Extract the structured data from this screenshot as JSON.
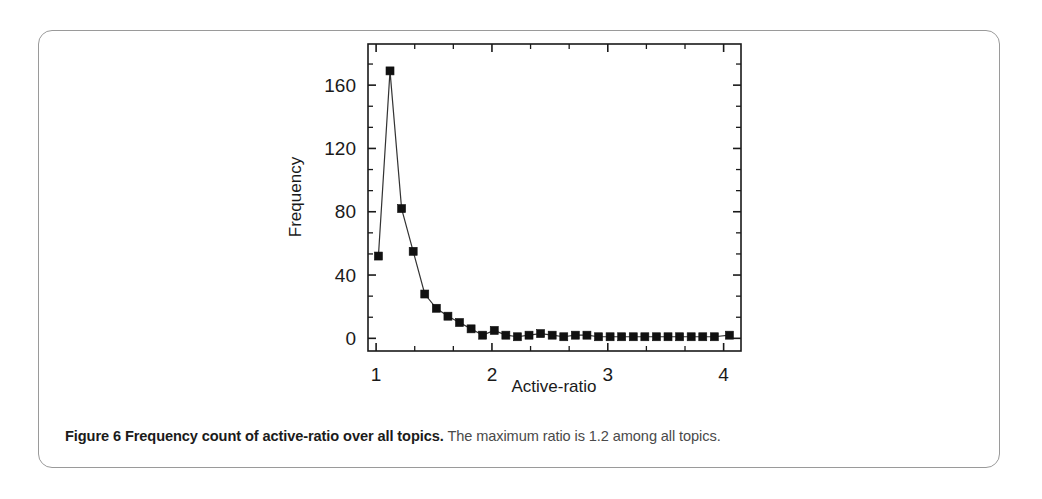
{
  "figure": {
    "caption_bold": "Figure 6  Frequency count of active-ratio over all topics.",
    "caption_rest": " The maximum ratio is 1.2 among all topics."
  },
  "chart_data": {
    "type": "line",
    "title": "",
    "xlabel": "Active-ratio",
    "ylabel": "Frequency",
    "xlim": [
      0.93,
      4.15
    ],
    "ylim": [
      -8,
      186
    ],
    "xticks": [
      1,
      2,
      3,
      4
    ],
    "xtick_labels": [
      "1",
      "2",
      "3",
      "4"
    ],
    "yticks": [
      0,
      40,
      80,
      120,
      160
    ],
    "ytick_labels": [
      "0",
      "40",
      "80",
      "120",
      "160"
    ],
    "x_minor_per_major": 2,
    "y_minor_per_major": 2,
    "grid": false,
    "legend": null,
    "marker": "filled-square",
    "marker_color": "#111111",
    "line_color": "#333333",
    "x": [
      1.02,
      1.12,
      1.22,
      1.32,
      1.42,
      1.52,
      1.62,
      1.72,
      1.82,
      1.92,
      2.02,
      2.12,
      2.22,
      2.32,
      2.42,
      2.52,
      2.62,
      2.72,
      2.82,
      2.92,
      3.02,
      3.12,
      3.22,
      3.32,
      3.42,
      3.52,
      3.62,
      3.72,
      3.82,
      3.92,
      4.05
    ],
    "values": [
      52,
      169,
      82,
      55,
      28,
      19,
      14,
      10,
      6,
      2,
      5,
      2,
      1,
      2,
      3,
      2,
      1,
      2,
      2,
      1,
      1,
      1,
      1,
      1,
      1,
      1,
      1,
      1,
      1,
      1,
      2
    ]
  }
}
